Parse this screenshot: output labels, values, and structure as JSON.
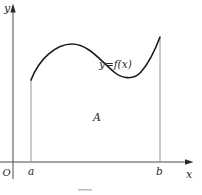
{
  "figure": {
    "type": "area-under-curve-diagram",
    "curve_label": "y=f(x)",
    "region_label": "A",
    "origin_label": "O",
    "x_axis_label": "x",
    "y_axis_label": "y",
    "interval_left_label": "a",
    "interval_right_label": "b",
    "colors": {
      "background": "#ffffff",
      "curve": "#1c1c1c",
      "axis": "#4d4d4d",
      "boundary_line": "#8a8a8a",
      "text": "#2a2a2a",
      "caption_fragment": "#c0c0c0"
    },
    "geometry": {
      "x_axis_y": 162,
      "y_axis_x": 13,
      "interval_left_x": 31,
      "interval_right_x": 160,
      "curve_start": [
        31,
        80
      ],
      "curve_local_max": [
        72,
        44
      ],
      "curve_local_min": [
        127,
        78
      ],
      "curve_end": [
        160,
        37
      ]
    }
  }
}
